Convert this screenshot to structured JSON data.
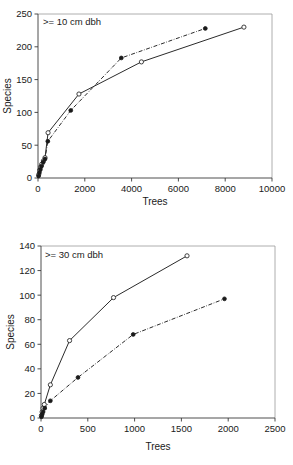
{
  "figure": {
    "background": "#ffffff",
    "line_color": "#2b2b2b",
    "panels": [
      "chart-top",
      "chart-bottom"
    ]
  },
  "chart_data": [
    {
      "type": "line",
      "panel": "top",
      "title": "",
      "annotation": ">= 10 cm dbh",
      "xlabel": "Trees",
      "ylabel": "Species",
      "xlim": [
        0,
        10000
      ],
      "ylim": [
        0,
        250
      ],
      "xticks": [
        0,
        2000,
        4000,
        6000,
        8000,
        10000
      ],
      "yticks": [
        0,
        50,
        100,
        150,
        200,
        250
      ],
      "xticklabels": [
        "0",
        "2000",
        "4000",
        "6000",
        "8000",
        "10000"
      ],
      "yticklabels": [
        "0",
        "50",
        "100",
        "150",
        "200",
        "250"
      ],
      "grid": false,
      "legend": "none",
      "series": [
        {
          "name": "open-circle-solid",
          "marker": "open-circle",
          "linestyle": "solid",
          "points": [
            [
              30,
              5
            ],
            [
              70,
              12
            ],
            [
              110,
              17
            ],
            [
              160,
              21
            ],
            [
              230,
              26
            ],
            [
              300,
              31
            ],
            [
              430,
              69
            ],
            [
              1750,
              128
            ],
            [
              4420,
              177
            ],
            [
              8800,
              230
            ]
          ]
        },
        {
          "name": "filled-circle-dashdot",
          "marker": "filled-circle",
          "linestyle": "dashdot",
          "points": [
            [
              25,
              3
            ],
            [
              60,
              8
            ],
            [
              100,
              13
            ],
            [
              150,
              18
            ],
            [
              220,
              24
            ],
            [
              300,
              29
            ],
            [
              420,
              56
            ],
            [
              1400,
              103
            ],
            [
              3560,
              183
            ],
            [
              7150,
              228
            ]
          ]
        }
      ]
    },
    {
      "type": "line",
      "panel": "bottom",
      "title": "",
      "annotation": ">= 30 cm dbh",
      "xlabel": "Trees",
      "ylabel": "Species",
      "xlim": [
        0,
        2500
      ],
      "ylim": [
        0,
        140
      ],
      "xticks": [
        0,
        500,
        1000,
        1500,
        2000,
        2500
      ],
      "yticks": [
        0,
        20,
        40,
        60,
        80,
        100,
        120,
        140
      ],
      "xticklabels": [
        "0",
        "500",
        "1000",
        "1500",
        "2000",
        "2500"
      ],
      "yticklabels": [
        "0",
        "20",
        "40",
        "60",
        "80",
        "100",
        "120",
        "140"
      ],
      "grid": false,
      "legend": "none",
      "series": [
        {
          "name": "open-circle-solid",
          "marker": "open-circle",
          "linestyle": "solid",
          "points": [
            [
              5,
              2
            ],
            [
              12,
              5
            ],
            [
              22,
              8
            ],
            [
              35,
              11
            ],
            [
              100,
              27
            ],
            [
              305,
              63
            ],
            [
              775,
              98
            ],
            [
              1560,
              132
            ]
          ]
        },
        {
          "name": "filled-circle-dashdot",
          "marker": "filled-circle",
          "linestyle": "dashdot",
          "points": [
            [
              5,
              1
            ],
            [
              12,
              3
            ],
            [
              22,
              5
            ],
            [
              40,
              8
            ],
            [
              100,
              14
            ],
            [
              395,
              33
            ],
            [
              985,
              68
            ],
            [
              1960,
              97
            ]
          ]
        }
      ]
    }
  ]
}
